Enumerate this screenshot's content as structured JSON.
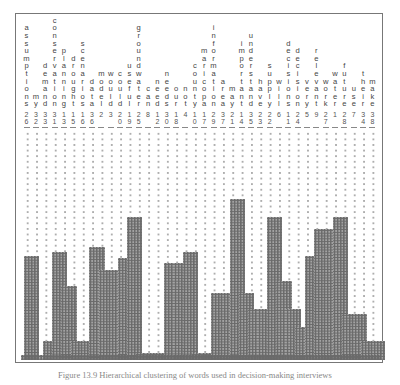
{
  "figure": {
    "type": "icicle-plot",
    "caption": "Figure 13.9  Hierarchical clustering of words used in decision-making interviews"
  },
  "chart_data": {
    "type": "dendrogram-icicle",
    "title": "",
    "leaves": [
      {
        "word": "assumptions",
        "id": "26",
        "top": 0.57
      },
      {
        "word": "my",
        "id": "32",
        "top": null
      },
      {
        "word": "demand",
        "id": "33",
        "top": 0.94
      },
      {
        "word": "conservation",
        "id": "31",
        "top": 0.55
      },
      {
        "word": "planning",
        "id": "13",
        "top": 0.7
      },
      {
        "word": "drought",
        "id": "15",
        "top": 0.94
      },
      {
        "word": "scenarios",
        "id": "16",
        "top": 0.94
      },
      {
        "word": "data",
        "id": "36",
        "top": 0.53
      },
      {
        "word": "model",
        "id": "2",
        "top": 0.63
      },
      {
        "word": "would",
        "id": "3",
        "top": 0.63
      },
      {
        "word": "could",
        "id": "20",
        "top": 0.58
      },
      {
        "word": "useful",
        "id": "19",
        "top": 0.4
      },
      {
        "word": "groundwater",
        "id": "25",
        "top": 0.99
      },
      {
        "word": "can",
        "id": "8",
        "top": 0.99
      },
      {
        "word": "need",
        "id": "12",
        "top": 0.99
      },
      {
        "word": "needs",
        "id": "30",
        "top": 0.6
      },
      {
        "word": "our",
        "id": "18",
        "top": 0.6
      },
      {
        "word": "not",
        "id": "4",
        "top": 0.55
      },
      {
        "word": "county",
        "id": "10",
        "top": 0.99
      },
      {
        "word": "maricopa",
        "id": "17",
        "top": 0.99
      },
      {
        "word": "information",
        "id": "29",
        "top": 0.73
      },
      {
        "word": "area",
        "id": "37",
        "top": 0.73
      },
      {
        "word": "may",
        "id": "21",
        "top": 0.32
      },
      {
        "word": "important",
        "id": "14",
        "top": 0.73
      },
      {
        "word": "understand",
        "id": "35",
        "top": 0.8
      },
      {
        "word": "have",
        "id": "23",
        "top": 0.8
      },
      {
        "word": "supply",
        "id": "22",
        "top": 0.4
      },
      {
        "word": "will",
        "id": "6",
        "top": 0.68
      },
      {
        "word": "decisions",
        "id": "11",
        "top": 0.8
      },
      {
        "word": "decision",
        "id": "24",
        "top": 0.88
      },
      {
        "word": "very",
        "id": "5",
        "top": 0.57
      },
      {
        "word": "relevant",
        "id": "9",
        "top": 0.45
      },
      {
        "word": "work",
        "id": "27",
        "top": 0.45
      },
      {
        "word": "water",
        "id": "1",
        "top": 0.4
      },
      {
        "word": "future",
        "id": "28",
        "top": 0.82
      },
      {
        "word": "use",
        "id": "7",
        "top": 0.82
      },
      {
        "word": "their",
        "id": "34",
        "top": 0.94
      },
      {
        "word": "make",
        "id": "38",
        "top": 0.94
      }
    ]
  }
}
